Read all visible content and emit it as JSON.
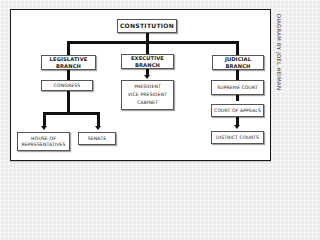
{
  "diagram": {
    "root": {
      "label": "CONSTITUTION"
    },
    "branches": [
      {
        "label_line1": "LEGISLATIVE",
        "label_line2": "BRANCH",
        "children": [
          {
            "label": "CONGRESS"
          }
        ],
        "sub_children": [
          {
            "label_line1": "HOUSE OF",
            "label_line2": "REPRESENTATIVES"
          },
          {
            "label": "SENATE"
          }
        ]
      },
      {
        "label_line1": "EXECUTIVE",
        "label_line2": "BRANCH",
        "children": [
          {
            "lines": [
              "PRESIDENT",
              "VICE PRESIDENT",
              "CABINET"
            ]
          }
        ]
      },
      {
        "label_line1": "JUDICIAL",
        "label_line2": "BRANCH",
        "children": [
          {
            "label": "SUPREME COURT"
          },
          {
            "label": "COURT OF APPEALS"
          },
          {
            "label": "DISTRICT COURTS"
          }
        ]
      }
    ],
    "credit": "DIAGRAM BY JOEL HEIMAN",
    "colors": {
      "background": "#ececec",
      "frame": "#ffffff",
      "lines": "#111111",
      "text": "#222222"
    }
  }
}
